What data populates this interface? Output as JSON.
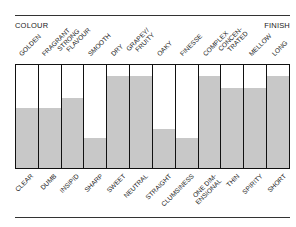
{
  "header": {
    "left_label": "COLOUR",
    "right_label": "FINISH"
  },
  "chart_data": {
    "type": "bar",
    "title": "",
    "xlabel": "",
    "ylabel": "",
    "ylim": [
      0,
      100
    ],
    "grid": false,
    "legend": null,
    "axis_ends": {
      "left": "COLOUR",
      "right": "FINISH"
    },
    "categories": [
      "GOLDEN",
      "FRAGRANT",
      "STRONG FLAVOUR",
      "SMOOTH",
      "DRY",
      "GRAPEY/ FRUITY",
      "OAKY",
      "FINESSE",
      "COMPLEX",
      "CONCEN- TRATED",
      "MELLOW",
      "LONG"
    ],
    "opposite_labels": [
      "CLEAR",
      "DUMB",
      "INSIPID",
      "SHARP",
      "SWEET",
      "NEUTRAL",
      "STRAIGHT",
      "CLUMSINESS",
      "ONE DIM- ENSIONAL",
      "THIN",
      "SPIRITY",
      "SHORT"
    ],
    "values": [
      58,
      58,
      68,
      29,
      89,
      89,
      38,
      29,
      89,
      78,
      78,
      89
    ],
    "fill_color": "#c8c8c8"
  },
  "top_labels": [
    {
      "l1": "GOLDEN",
      "l2": ""
    },
    {
      "l1": "FRAGRANT",
      "l2": ""
    },
    {
      "l1": "STRONG",
      "l2": "FLAVOUR"
    },
    {
      "l1": "SMOOTH",
      "l2": ""
    },
    {
      "l1": "DRY",
      "l2": ""
    },
    {
      "l1": "GRAPEY/",
      "l2": "FRUITY"
    },
    {
      "l1": "OAKY",
      "l2": ""
    },
    {
      "l1": "FINESSE",
      "l2": ""
    },
    {
      "l1": "COMPLEX",
      "l2": ""
    },
    {
      "l1": "CONCEN-",
      "l2": "TRATED"
    },
    {
      "l1": "MELLOW",
      "l2": ""
    },
    {
      "l1": "LONG",
      "l2": ""
    }
  ],
  "bottom_labels": [
    {
      "l1": "CLEAR",
      "l2": ""
    },
    {
      "l1": "DUMB",
      "l2": ""
    },
    {
      "l1": "INSIPID",
      "l2": ""
    },
    {
      "l1": "SHARP",
      "l2": ""
    },
    {
      "l1": "SWEET",
      "l2": ""
    },
    {
      "l1": "NEUTRAL",
      "l2": ""
    },
    {
      "l1": "STRAIGHT",
      "l2": ""
    },
    {
      "l1": "CLUMSINESS",
      "l2": ""
    },
    {
      "l1": "ONE DIM-",
      "l2": "ENSIONAL"
    },
    {
      "l1": "THIN",
      "l2": ""
    },
    {
      "l1": "SPIRITY",
      "l2": ""
    },
    {
      "l1": "SHORT",
      "l2": ""
    }
  ]
}
